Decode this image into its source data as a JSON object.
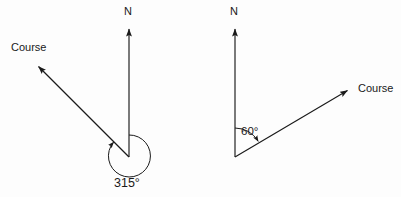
{
  "figure": {
    "type": "bearing-diagram",
    "background_color": "#fdfdfd",
    "stroke_color": "#1a1a1a",
    "width": 401,
    "height": 197
  },
  "diagrams": [
    {
      "id": "left",
      "north_label": "N",
      "course_label": "Course",
      "angle_label": "315°",
      "angle_value": 315,
      "angle_direction": "clockwise-from-north",
      "vertex": {
        "x": 129,
        "y": 157
      },
      "north_arrow_tip": {
        "x": 129,
        "y": 25
      },
      "course_arrow_tip": {
        "x": 34,
        "y": 63
      },
      "arc": {
        "cx": 129,
        "cy": 156,
        "r": 21
      }
    },
    {
      "id": "right",
      "north_label": "N",
      "course_label": "Course",
      "angle_label": "60°",
      "angle_value": 60,
      "angle_direction": "clockwise-from-north",
      "vertex": {
        "x": 235,
        "y": 156
      },
      "north_arrow_tip": {
        "x": 235,
        "y": 25
      },
      "course_arrow_tip": {
        "x": 352,
        "y": 88
      },
      "arc": {
        "cx": 235,
        "cy": 156,
        "r": 28
      }
    }
  ],
  "labels": {
    "left_north": "N",
    "left_course": "Course",
    "left_angle": "315°",
    "right_north": "N",
    "right_course": "Course",
    "right_angle": "60°"
  }
}
